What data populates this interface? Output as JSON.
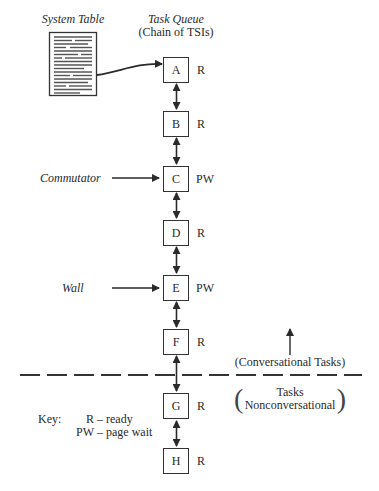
{
  "header": {
    "system_table_label": "System Table",
    "task_queue_title": "Task Queue",
    "task_queue_subtitle": "(Chain of TSIs)"
  },
  "queue": [
    {
      "id": "A",
      "status": "R"
    },
    {
      "id": "B",
      "status": "R"
    },
    {
      "id": "C",
      "status": "PW"
    },
    {
      "id": "D",
      "status": "R"
    },
    {
      "id": "E",
      "status": "PW"
    },
    {
      "id": "F",
      "status": "R"
    },
    {
      "id": "G",
      "status": "R"
    },
    {
      "id": "H",
      "status": "R"
    }
  ],
  "pointers": {
    "commutator": "Commutator",
    "wall": "Wall"
  },
  "divider": {
    "above_label": "(Conversational Tasks)",
    "below_label_line1": "Tasks",
    "below_label_line2": "Nonconversational"
  },
  "key": {
    "title": "Key:",
    "entries": [
      {
        "code": "R",
        "meaning": "ready"
      },
      {
        "code": "PW",
        "meaning": "page wait"
      }
    ]
  },
  "colors": {
    "ink": "#2a2a2a",
    "background": "#ffffff"
  }
}
